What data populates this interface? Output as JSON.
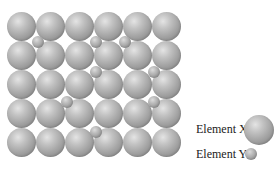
{
  "diagram": {
    "type": "crystal-lattice-interstitial-alloy",
    "lattice": {
      "columns": 6,
      "rows": 5,
      "origin_x": 7,
      "origin_y": 12,
      "pitch": 29,
      "large_diameter": 29
    },
    "interstitials": [
      {
        "x": 38,
        "y": 42
      },
      {
        "x": 96,
        "y": 42
      },
      {
        "x": 125,
        "y": 42
      },
      {
        "x": 96,
        "y": 72
      },
      {
        "x": 154,
        "y": 72
      },
      {
        "x": 67,
        "y": 102
      },
      {
        "x": 154,
        "y": 102
      },
      {
        "x": 96,
        "y": 132
      }
    ],
    "small_diameter": 12,
    "colors": {
      "sphere_light": "#e4e4e4",
      "sphere_mid": "#a3a3a3",
      "sphere_dark": "#8a8a8a",
      "background": "#ffffff"
    }
  },
  "legend": {
    "items": [
      {
        "label": "Element X",
        "size": "large"
      },
      {
        "label": "Element Y",
        "size": "small"
      }
    ]
  }
}
